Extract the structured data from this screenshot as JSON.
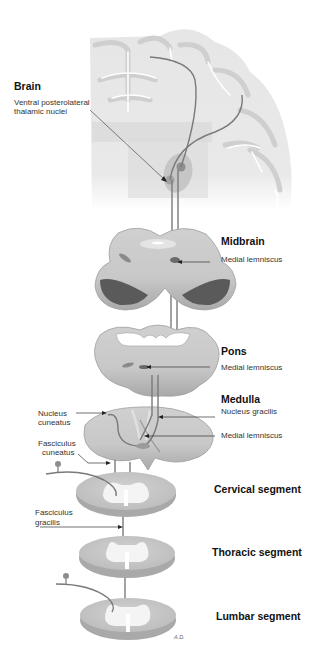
{
  "diagram": {
    "type": "anatomical pathway diagram",
    "signature": "A.D.",
    "colors": {
      "tissue_light": "#dcdcdc",
      "tissue_mid": "#c4c4c4",
      "tissue_dark": "#8a8a8a",
      "pathway": "#7a7a7a",
      "white_matter": "#f4f4f4",
      "text": "#222222"
    },
    "levels": [
      {
        "id": "brain",
        "title": "Brain",
        "annotations": [
          {
            "label": "Ventral posterolateral thalamic nuclei"
          }
        ]
      },
      {
        "id": "midbrain",
        "title": "Midbrain",
        "annotations": [
          {
            "label": "Medial lemniscus"
          }
        ]
      },
      {
        "id": "pons",
        "title": "Pons",
        "annotations": [
          {
            "label": "Medial lemniscus"
          }
        ]
      },
      {
        "id": "medulla",
        "title": "Medulla",
        "annotations": [
          {
            "label": "Nucleus gracilis"
          },
          {
            "label": "Medial lemniscus"
          },
          {
            "label": "Nucleus cuneatus"
          }
        ]
      },
      {
        "id": "cervical",
        "title": "Cervical segment",
        "annotations": [
          {
            "label": "Fasciculus cuneatus"
          }
        ]
      },
      {
        "id": "thoracic",
        "title": "Thoracic segment",
        "annotations": [
          {
            "label": "Fasciculus gracilis"
          }
        ]
      },
      {
        "id": "lumbar",
        "title": "Lumbar segment",
        "annotations": []
      }
    ]
  },
  "labels": {
    "brain": "Brain",
    "vpl_line1": "Ventral posterolateral",
    "vpl_line2": "thalamic nuclei",
    "midbrain": "Midbrain",
    "midbrain_ml": "Medial lemniscus",
    "pons": "Pons",
    "pons_ml": "Medial lemniscus",
    "medulla": "Medulla",
    "nucleus_gracilis": "Nucleus gracilis",
    "medulla_ml": "Medial lemniscus",
    "nucleus_cuneatus_line1": "Nucleus",
    "nucleus_cuneatus_line2": "cuneatus",
    "fasciculus_cuneatus_line1": "Fasciculus",
    "fasciculus_cuneatus_line2": "cuneatus",
    "cervical": "Cervical segment",
    "fasciculus_gracilis_line1": "Fasciculus",
    "fasciculus_gracilis_line2": "gracilis",
    "thoracic": "Thoracic segment",
    "lumbar": "Lumbar segment",
    "signature": "A.D."
  }
}
